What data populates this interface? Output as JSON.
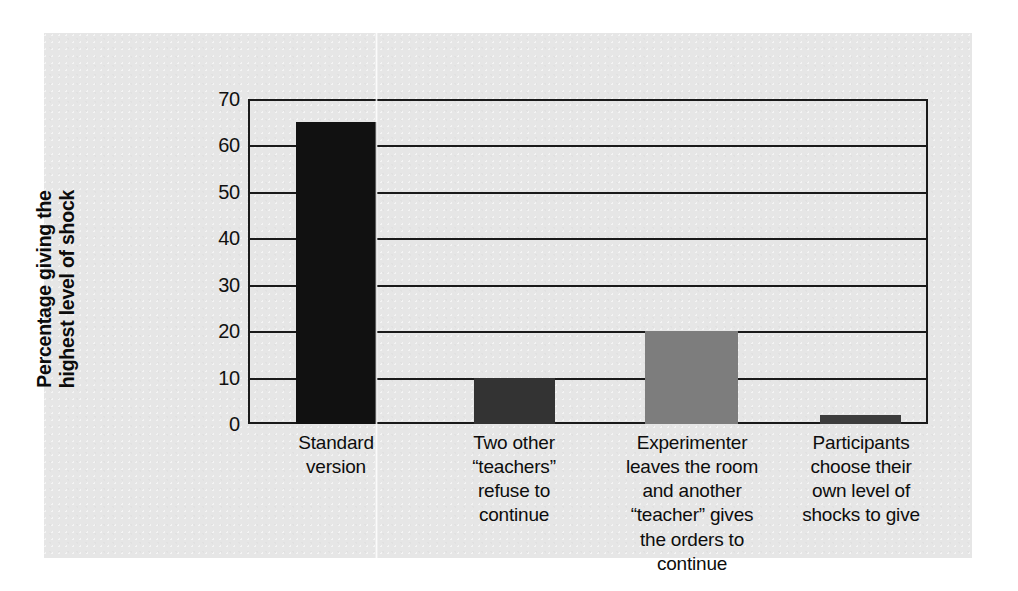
{
  "chart_data": {
    "type": "bar",
    "title": "",
    "xlabel": "",
    "ylabel": "Percentage giving the highest level of shock",
    "ylabel_lines": [
      "Percentage giving the",
      "highest level of shock"
    ],
    "ylim": [
      0,
      70
    ],
    "ytick_labels": [
      "0",
      "10",
      "20",
      "30",
      "40",
      "50",
      "60",
      "70"
    ],
    "ytick_values": [
      0,
      10,
      20,
      30,
      40,
      50,
      60,
      70
    ],
    "grid": "horizontal",
    "legend": "none",
    "categories": [
      "Standard version",
      "Two other “teachers” refuse to continue",
      "Experimenter leaves the room and another “teacher” gives the orders to continue",
      "Participants choose their own level of shocks to give"
    ],
    "category_lines": [
      [
        "Standard",
        "version"
      ],
      [
        "Two other",
        "“teachers”",
        "refuse to",
        "continue"
      ],
      [
        "Experimenter",
        "leaves the room",
        "and another",
        "“teacher” gives",
        "the orders to",
        "continue"
      ],
      [
        "Participants",
        "choose their",
        "own level of",
        "shocks to give"
      ]
    ],
    "values": [
      65,
      10,
      20,
      2
    ],
    "bar_colors": [
      "#111111",
      "#333333",
      "#7d7d7d",
      "#3d3d3d"
    ]
  },
  "figure": {
    "panel_color": "#e6e6e6",
    "axis_color": "#1a1a1a",
    "page_color": "#ffffff"
  }
}
